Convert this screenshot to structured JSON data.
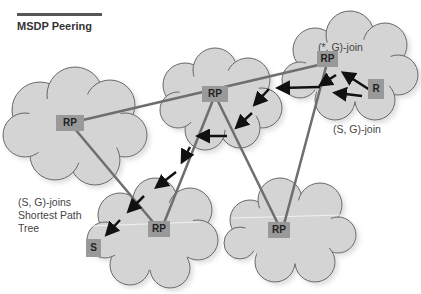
{
  "title": "MSDP Peering",
  "labels": {
    "star_g_join": "(*, G)-join",
    "s_g_join": "(S, G)-join",
    "s_g_joins_line1": "(S, G)-joins",
    "s_g_joins_line2": "Shortest Path",
    "s_g_joins_line3": "Tree"
  },
  "nodes": {
    "rp_left": "RP",
    "rp_center": "RP",
    "rp_top_right": "RP",
    "receiver": "R",
    "rp_bottom_left": "RP",
    "rp_bottom_right": "RP",
    "source": "S"
  },
  "colors": {
    "cloud_fill": "#d4d4d4",
    "cloud_stroke": "#666666",
    "peering_line": "#6e6e6e",
    "arrow": "#111111",
    "node_fill": "#999999"
  }
}
